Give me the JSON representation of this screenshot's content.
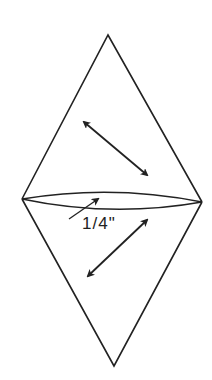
{
  "diagram": {
    "seam_allowance_label": "1/4\"",
    "stroke_color": "#222222",
    "background": "#ffffff"
  }
}
